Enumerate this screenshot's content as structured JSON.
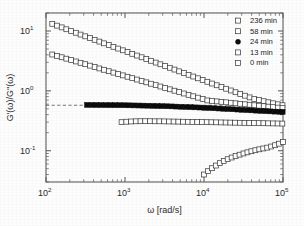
{
  "figure": {
    "background_color": "#fdfdfd",
    "axis_color": "#5d5d5d",
    "marker_open_fill": "#ffffff",
    "marker_edge_color": "#3a3a3a",
    "marker_filled_color": "#0b0b0b"
  },
  "axes": {
    "x_title": "ω [rad/s]",
    "y_title": "G'(ω)/G''(ω)",
    "x_tick_labels": [
      "10",
      "10",
      "10",
      "10"
    ],
    "x_tick_exponents": [
      "2",
      "3",
      "4",
      "5"
    ],
    "y_tick_labels": [
      "10",
      "10",
      "10"
    ],
    "y_tick_exponents": [
      "1",
      "0",
      "-1"
    ]
  },
  "legend": {
    "entries": [
      {
        "label": "236 min",
        "marker": "open-square"
      },
      {
        "label": "58 min",
        "marker": "open-square"
      },
      {
        "label": "24 min",
        "marker": "filled-circle"
      },
      {
        "label": "13 min",
        "marker": "open-square"
      },
      {
        "label": "0 min",
        "marker": "open-square"
      }
    ]
  },
  "chart_data": {
    "type": "scatter",
    "title": "",
    "xlabel": "ω [rad/s]",
    "ylabel": "G'(ω)/G''(ω)",
    "xscale": "log",
    "yscale": "log",
    "xlim": [
      100,
      100000
    ],
    "ylim": [
      0.03,
      20
    ],
    "x_ticks": [
      100,
      1000,
      10000,
      100000
    ],
    "y_ticks": [
      0.1,
      1,
      10
    ],
    "grid": false,
    "legend_position": "top-right",
    "annotations": [
      {
        "type": "horizontal-dashed-line",
        "y": 0.575,
        "x_start": 100,
        "x_end": 100000,
        "description": "gel-point reference line G'/G'' at plateau of 24 min curve"
      }
    ],
    "series": [
      {
        "name": "236 min",
        "marker": "open-square",
        "x": [
          120,
          138,
          158,
          181,
          208,
          239,
          274,
          314,
          360,
          413,
          474,
          543,
          623,
          714,
          819,
          939,
          1077,
          1235,
          1416,
          1624,
          1862,
          2135,
          2448,
          2807,
          3219,
          3691,
          4232,
          4852,
          5564,
          6380,
          7315,
          8388,
          9619,
          11030,
          12648,
          14503,
          16630,
          19069,
          21866,
          25073,
          28750,
          32966,
          37798,
          43338,
          49691,
          56975,
          65329,
          74910,
          85896,
          98491
        ],
        "y": [
          13.2,
          12.3,
          11.5,
          10.7,
          10.0,
          9.35,
          8.72,
          8.15,
          7.62,
          7.12,
          6.66,
          6.23,
          5.82,
          5.44,
          5.09,
          4.76,
          4.45,
          4.16,
          3.89,
          3.64,
          3.4,
          3.18,
          2.97,
          2.78,
          2.6,
          2.43,
          2.27,
          2.12,
          1.985,
          1.855,
          1.735,
          1.622,
          1.517,
          1.418,
          1.326,
          1.24,
          1.16,
          1.085,
          1.015,
          0.949,
          0.888,
          0.831,
          0.778,
          0.728,
          0.702,
          0.672,
          0.645,
          0.62,
          0.597,
          0.576
        ]
      },
      {
        "name": "58 min",
        "marker": "open-square",
        "x": [
          120,
          138,
          158,
          181,
          208,
          239,
          274,
          314,
          360,
          413,
          474,
          543,
          623,
          714,
          819,
          939,
          1077,
          1235,
          1416,
          1624,
          1862,
          2135,
          2448,
          2807,
          3219,
          3691,
          4232,
          4852,
          5564,
          6380,
          7315,
          8388,
          9619,
          11030,
          12648,
          14503,
          16630,
          19069,
          21866,
          25073,
          28750,
          32966,
          37798,
          43338,
          49691,
          56975,
          65329,
          74910,
          85896,
          98491
        ],
        "y": [
          4.05,
          3.84,
          3.64,
          3.45,
          3.27,
          3.1,
          2.94,
          2.79,
          2.64,
          2.5,
          2.37,
          2.25,
          2.13,
          2.02,
          1.915,
          1.815,
          1.72,
          1.63,
          1.545,
          1.465,
          1.388,
          1.316,
          1.247,
          1.182,
          1.12,
          1.062,
          1.006,
          0.954,
          0.904,
          0.857,
          0.812,
          0.77,
          0.73,
          0.692,
          0.68,
          0.668,
          0.656,
          0.644,
          0.632,
          0.62,
          0.608,
          0.597,
          0.586,
          0.575,
          0.565,
          0.555,
          0.545,
          0.535,
          0.525,
          0.515
        ]
      },
      {
        "name": "24 min",
        "marker": "filled-circle",
        "x": [
          330,
          379,
          434,
          498,
          571,
          655,
          751,
          861,
          988,
          1133,
          1299,
          1490,
          1709,
          1960,
          2248,
          2578,
          2957,
          3391,
          3889,
          4460,
          5115,
          5866,
          6727,
          7715,
          8848,
          10147,
          11637,
          13346,
          15306,
          17555,
          20135,
          23092,
          26483,
          30372,
          34831,
          39944,
          45809,
          52533,
          60245,
          69089,
          79232,
          90863,
          99000
        ],
        "y": [
          0.583,
          0.582,
          0.581,
          0.58,
          0.579,
          0.578,
          0.577,
          0.576,
          0.575,
          0.573,
          0.571,
          0.569,
          0.567,
          0.565,
          0.562,
          0.559,
          0.556,
          0.553,
          0.55,
          0.546,
          0.542,
          0.538,
          0.534,
          0.53,
          0.526,
          0.521,
          0.517,
          0.512,
          0.507,
          0.502,
          0.497,
          0.492,
          0.487,
          0.482,
          0.477,
          0.472,
          0.467,
          0.462,
          0.458,
          0.454,
          0.45,
          0.447,
          0.445
        ]
      },
      {
        "name": "13 min",
        "marker": "open-square",
        "x": [
          905,
          1039,
          1192,
          1369,
          1571,
          1803,
          2070,
          2376,
          2727,
          3130,
          3592,
          4123,
          4733,
          5432,
          6234,
          7155,
          8212,
          9426,
          10819,
          12418,
          14253,
          16359,
          18776,
          21550,
          24733,
          28387,
          32580,
          37393,
          42915,
          49254,
          56529,
          64880,
          74465,
          85468,
          98091
        ],
        "y": [
          0.3,
          0.305,
          0.308,
          0.31,
          0.311,
          0.311,
          0.311,
          0.31,
          0.31,
          0.309,
          0.308,
          0.307,
          0.306,
          0.305,
          0.304,
          0.303,
          0.302,
          0.301,
          0.3,
          0.299,
          0.298,
          0.297,
          0.296,
          0.295,
          0.294,
          0.293,
          0.292,
          0.291,
          0.29,
          0.289,
          0.288,
          0.287,
          0.286,
          0.285,
          0.284
        ]
      },
      {
        "name": "0 min",
        "marker": "open-square",
        "x": [
          10000,
          11220,
          12589,
          14125,
          15849,
          17783,
          19953,
          22387,
          25119,
          28184,
          31623,
          35481,
          39811,
          44668,
          50119,
          56234,
          63096,
          70795,
          79433,
          89125,
          100000
        ],
        "y": [
          0.04,
          0.0455,
          0.051,
          0.0565,
          0.062,
          0.0672,
          0.0722,
          0.077,
          0.0815,
          0.0858,
          0.09,
          0.094,
          0.098,
          0.1018,
          0.1055,
          0.109,
          0.1125,
          0.1175,
          0.1235,
          0.131,
          0.14
        ]
      }
    ]
  }
}
